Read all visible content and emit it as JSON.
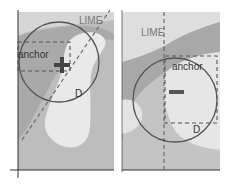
{
  "figure": {
    "panels": [
      {
        "id": "left",
        "labels": {
          "line": "LIME",
          "box": "anchor",
          "circle": "D"
        },
        "anchor_marker": "plus-icon"
      },
      {
        "id": "right",
        "labels": {
          "line": "LIME",
          "box": "anchor",
          "circle": "D"
        },
        "anchor_marker": "minus-icon"
      }
    ],
    "colors": {
      "background": "#ffffff",
      "region_dark": "#b4b4b4",
      "region_mid": "#c6c6c6",
      "region_light": "#e6e6e6",
      "stroke": "#555555",
      "dash": "#6a6a6a",
      "marker": "#444444",
      "axis": "#333333"
    }
  }
}
